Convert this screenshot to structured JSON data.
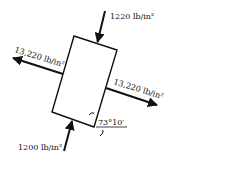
{
  "diagram": {
    "element": {
      "shape": "rectangle",
      "corners": [
        [
          74,
          36
        ],
        [
          117,
          50
        ],
        [
          94,
          127
        ],
        [
          52,
          112
        ]
      ],
      "stroke": "#111111"
    },
    "stresses": {
      "top": {
        "label": "1220 lb/in²",
        "type": "compressive"
      },
      "bottom": {
        "label": "1200 lb/in²",
        "type": "compressive"
      },
      "left": {
        "label": "13,220 lb/in²",
        "type": "tensile"
      },
      "right": {
        "label": "13,220 lb/in²",
        "type": "tensile"
      }
    },
    "angle": {
      "label": "73°10′"
    },
    "colors": {
      "ink": "#111111",
      "background": "#ffffff"
    }
  }
}
